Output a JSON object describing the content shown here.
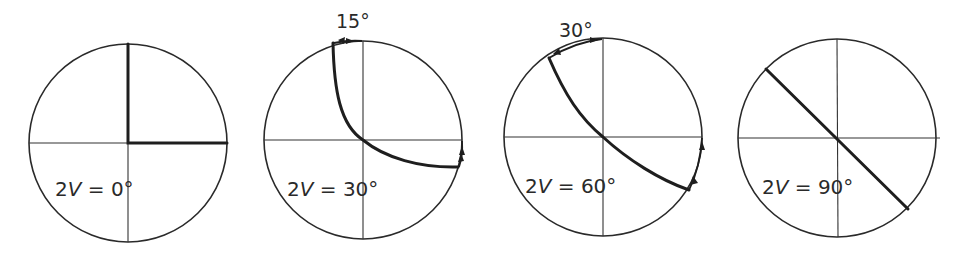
{
  "diagram": {
    "panels": [
      {
        "id": "p0",
        "label": "2V = 0°",
        "label_prefix": "2",
        "label_var": "V",
        "label_suffix": " = 0°",
        "top_angle": null
      },
      {
        "id": "p30",
        "label": "2V = 30°",
        "label_prefix": "2",
        "label_var": "V",
        "label_suffix": " = 30°",
        "top_angle": "15°"
      },
      {
        "id": "p60",
        "label": "2V = 60°",
        "label_prefix": "2",
        "label_var": "V",
        "label_suffix": " = 60°",
        "top_angle": "30°"
      },
      {
        "id": "p90",
        "label": "2V = 90°",
        "label_prefix": "2",
        "label_var": "V",
        "label_suffix": " = 90°",
        "top_angle": null
      }
    ]
  }
}
